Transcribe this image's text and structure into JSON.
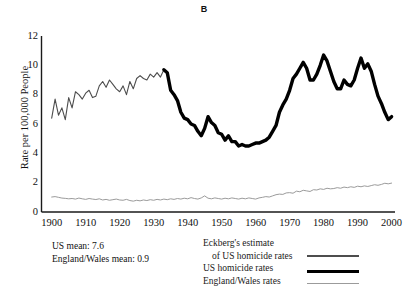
{
  "chart_data": {
    "type": "line",
    "title": "B",
    "xlabel": "",
    "ylabel": "Rate per 100,000 People",
    "xlim": [
      1897,
      2001
    ],
    "ylim": [
      0,
      12
    ],
    "yticks": [
      0,
      2,
      4,
      6,
      8,
      10,
      12
    ],
    "xticks": [
      1900,
      1910,
      1920,
      1930,
      1940,
      1950,
      1960,
      1970,
      1980,
      1990,
      2000
    ],
    "grid": false,
    "legend_position": "below-right",
    "annotations": [
      "US mean: 7.6",
      "England/Wales mean: 0.9"
    ],
    "series": [
      {
        "name": "Eckberg's estimate of US homicide rates",
        "color": "#4d4d4d",
        "linewidth": 1.1,
        "x": [
          1900,
          1901,
          1902,
          1903,
          1904,
          1905,
          1906,
          1907,
          1908,
          1909,
          1910,
          1911,
          1912,
          1913,
          1914,
          1915,
          1916,
          1917,
          1918,
          1919,
          1920,
          1921,
          1922,
          1923,
          1924,
          1925,
          1926,
          1927,
          1928,
          1929,
          1930,
          1931,
          1932,
          1933
        ],
        "values": [
          6.4,
          7.7,
          6.6,
          7.1,
          6.3,
          7.8,
          7.1,
          8.2,
          8.0,
          7.7,
          8.1,
          8.3,
          7.8,
          7.9,
          8.6,
          8.9,
          8.5,
          9.0,
          8.7,
          8.4,
          8.2,
          8.6,
          8.0,
          8.9,
          8.4,
          9.1,
          9.3,
          9.1,
          9.0,
          9.4,
          9.2,
          9.5,
          9.2,
          9.7
        ]
      },
      {
        "name": "US homicide rates",
        "color": "#000000",
        "linewidth": 3.4,
        "x": [
          1933,
          1934,
          1935,
          1936,
          1937,
          1938,
          1939,
          1940,
          1941,
          1942,
          1943,
          1944,
          1945,
          1946,
          1947,
          1948,
          1949,
          1950,
          1951,
          1952,
          1953,
          1954,
          1955,
          1956,
          1957,
          1958,
          1959,
          1960,
          1961,
          1962,
          1963,
          1964,
          1965,
          1966,
          1967,
          1968,
          1969,
          1970,
          1971,
          1972,
          1973,
          1974,
          1975,
          1976,
          1977,
          1978,
          1979,
          1980,
          1981,
          1982,
          1983,
          1984,
          1985,
          1986,
          1987,
          1988,
          1989,
          1990,
          1991,
          1992,
          1993,
          1994,
          1995,
          1996,
          1997,
          1998,
          1999,
          2000
        ],
        "values": [
          9.7,
          9.5,
          8.3,
          8.0,
          7.6,
          6.8,
          6.4,
          6.3,
          6.0,
          5.9,
          5.5,
          5.2,
          5.7,
          6.5,
          6.1,
          5.9,
          5.4,
          5.3,
          4.9,
          5.2,
          4.8,
          4.8,
          4.5,
          4.6,
          4.5,
          4.5,
          4.6,
          4.7,
          4.7,
          4.8,
          4.9,
          5.1,
          5.5,
          5.9,
          6.8,
          7.3,
          7.7,
          8.3,
          9.1,
          9.4,
          9.8,
          10.2,
          9.8,
          9.0,
          9.0,
          9.4,
          10.0,
          10.7,
          10.3,
          9.6,
          8.9,
          8.4,
          8.4,
          9.0,
          8.7,
          8.6,
          9.0,
          9.8,
          10.5,
          9.8,
          10.1,
          9.6,
          8.7,
          7.9,
          7.4,
          6.8,
          6.3,
          6.5
        ]
      },
      {
        "name": "England/Wales rates",
        "color": "#9b9b9b",
        "linewidth": 1.0,
        "x": [
          1900,
          1901,
          1902,
          1903,
          1904,
          1905,
          1906,
          1907,
          1908,
          1909,
          1910,
          1911,
          1912,
          1913,
          1914,
          1915,
          1916,
          1917,
          1918,
          1919,
          1920,
          1921,
          1922,
          1923,
          1924,
          1925,
          1926,
          1927,
          1928,
          1929,
          1930,
          1931,
          1932,
          1933,
          1934,
          1935,
          1936,
          1937,
          1938,
          1939,
          1940,
          1941,
          1942,
          1943,
          1944,
          1945,
          1946,
          1947,
          1948,
          1949,
          1950,
          1951,
          1952,
          1953,
          1954,
          1955,
          1956,
          1957,
          1958,
          1959,
          1960,
          1961,
          1962,
          1963,
          1964,
          1965,
          1966,
          1967,
          1968,
          1969,
          1970,
          1971,
          1972,
          1973,
          1974,
          1975,
          1976,
          1977,
          1978,
          1979,
          1980,
          1981,
          1982,
          1983,
          1984,
          1985,
          1986,
          1987,
          1988,
          1989,
          1990,
          1991,
          1992,
          1993,
          1994,
          1995,
          1996,
          1997,
          1998,
          1999,
          2000
        ],
        "values": [
          1.02,
          1.05,
          1.0,
          0.95,
          0.93,
          0.9,
          0.92,
          0.88,
          0.95,
          0.9,
          0.86,
          0.92,
          0.88,
          0.85,
          0.9,
          0.82,
          0.86,
          0.8,
          0.84,
          0.88,
          0.82,
          0.8,
          0.86,
          0.78,
          0.74,
          0.8,
          0.76,
          0.82,
          0.78,
          0.84,
          0.8,
          0.86,
          0.82,
          0.88,
          0.84,
          0.9,
          0.86,
          0.92,
          0.88,
          0.94,
          0.9,
          0.98,
          0.92,
          0.88,
          0.96,
          1.1,
          0.94,
          0.9,
          0.96,
          0.92,
          0.88,
          0.94,
          0.9,
          0.96,
          0.92,
          0.88,
          0.94,
          0.9,
          0.96,
          0.92,
          0.88,
          0.96,
          1.0,
          1.05,
          1.02,
          1.1,
          1.18,
          1.22,
          1.2,
          1.3,
          1.32,
          1.28,
          1.42,
          1.38,
          1.48,
          1.44,
          1.4,
          1.52,
          1.5,
          1.58,
          1.54,
          1.62,
          1.58,
          1.6,
          1.66,
          1.62,
          1.7,
          1.66,
          1.72,
          1.68,
          1.76,
          1.72,
          1.78,
          1.74,
          1.8,
          1.86,
          1.82,
          1.88,
          1.96,
          1.92,
          1.97
        ]
      }
    ]
  },
  "legend": {
    "rows": [
      {
        "label": "Eckberg's estimate",
        "indent": false
      },
      {
        "label": "of US homicide rates",
        "indent": true
      },
      {
        "label": "US homicide rates",
        "indent": false
      },
      {
        "label": "England/Wales rates",
        "indent": false
      }
    ]
  },
  "notes": {
    "us_mean": "US mean: 7.6",
    "ew_mean": "England/Wales mean: 0.9"
  }
}
